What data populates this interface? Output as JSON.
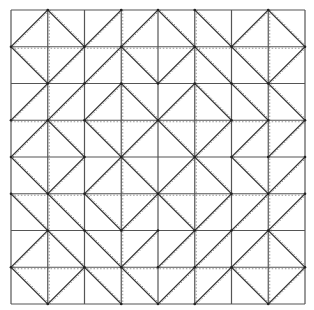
{
  "diagram": {
    "type": "grid-diagonal-pattern",
    "rows": 8,
    "cols": 8,
    "origin": [
      11,
      10
    ],
    "size": [
      294,
      294
    ],
    "colors": {
      "grid": "#555555",
      "diagonal": "#333333",
      "dotted": "#9a9a9a",
      "node": "#222222",
      "background": "#ffffff"
    },
    "diagonals": [
      [
        "/",
        "\\",
        "/",
        "/",
        "\\",
        "\\",
        "/",
        "\\"
      ],
      [
        "\\",
        "/",
        "/",
        "\\",
        "/",
        "\\",
        "\\",
        "/"
      ],
      [
        "/",
        "/",
        "/",
        "\\",
        "/",
        "\\",
        "\\",
        "\\"
      ],
      [
        "/",
        "\\",
        "\\",
        "/",
        "\\",
        "/",
        "/",
        "/"
      ],
      [
        "\\",
        "/",
        "/",
        "\\",
        "/",
        "\\",
        "\\",
        "/"
      ],
      [
        "\\",
        "\\",
        "\\",
        "/",
        "\\",
        "/",
        "/",
        "/"
      ],
      [
        "/",
        "\\",
        "\\",
        "/",
        "/",
        "/",
        "/",
        "\\"
      ],
      [
        "\\",
        "/",
        "\\",
        "\\",
        "/",
        "/",
        "\\",
        "/"
      ]
    ],
    "dotted_vertical_cols": [
      1,
      3,
      5,
      7
    ],
    "dotted_horizontal_rows": [
      1,
      3,
      5,
      7
    ],
    "dotted_diagonal_offset": 2
  }
}
